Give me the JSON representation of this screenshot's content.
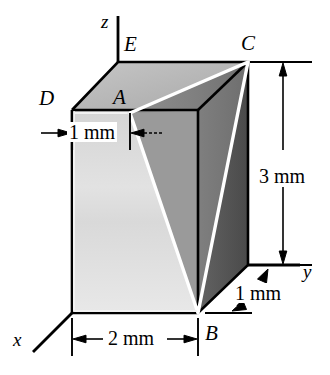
{
  "figure": {
    "kind": "engineering-solid-diagram",
    "background_color": "#ffffff",
    "line_color": "#000000",
    "highlight_color": "#ffffff"
  },
  "axes": [
    {
      "name": "z-axis",
      "label": "z",
      "direction": "up"
    },
    {
      "name": "y-axis",
      "label": "y",
      "direction": "right"
    },
    {
      "name": "x-axis",
      "label": "x",
      "direction": "down-left"
    }
  ],
  "vertices": [
    {
      "name": "vertex-E",
      "label": "E"
    },
    {
      "name": "vertex-C",
      "label": "C"
    },
    {
      "name": "vertex-D",
      "label": "D"
    },
    {
      "name": "vertex-A",
      "label": "A"
    },
    {
      "name": "vertex-B",
      "label": "B"
    }
  ],
  "dimensions": [
    {
      "name": "dim-width-1mm",
      "label": "1 mm",
      "orientation": "horizontal",
      "location": "upper-left"
    },
    {
      "name": "dim-height-3mm",
      "label": "3 mm",
      "orientation": "vertical",
      "location": "right"
    },
    {
      "name": "dim-depth-1mm",
      "label": "1 mm",
      "orientation": "oblique",
      "location": "lower-right"
    },
    {
      "name": "dim-length-2mm",
      "label": "2 mm",
      "orientation": "horizontal",
      "location": "bottom"
    }
  ],
  "faces": [
    {
      "name": "face-front-left",
      "shade": "#e3e3e3"
    },
    {
      "name": "face-top",
      "shade": "#b9b9b9"
    },
    {
      "name": "face-inclined",
      "shade": "#8a8a8a"
    },
    {
      "name": "face-right-side",
      "shade": "#565656"
    }
  ]
}
